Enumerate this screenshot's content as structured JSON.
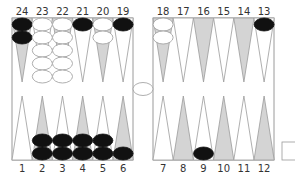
{
  "colors": {
    "board_bg": "#ffffff",
    "border": "#9a9a9a",
    "point_light": "#ffffff",
    "point_dark": "#d4d4d4",
    "checker_black": "#111111",
    "checker_white": "#ffffff",
    "checker_white_stroke": "#9a9a9a"
  },
  "top_points": [
    {
      "label": "24",
      "shade": "dark",
      "checkers": {
        "color": "black",
        "count": 2
      }
    },
    {
      "label": "23",
      "shade": "light",
      "checkers": {
        "color": "white",
        "count": 5
      }
    },
    {
      "label": "22",
      "shade": "dark",
      "checkers": {
        "color": "white",
        "count": 5
      }
    },
    {
      "label": "21",
      "shade": "light",
      "checkers": {
        "color": "black",
        "count": 1
      }
    },
    {
      "label": "20",
      "shade": "dark",
      "checkers": {
        "color": "white",
        "count": 2
      }
    },
    {
      "label": "19",
      "shade": "light",
      "checkers": {
        "color": "black",
        "count": 1
      }
    },
    {
      "label": "18",
      "shade": "dark",
      "checkers": {
        "color": "white",
        "count": 2
      }
    },
    {
      "label": "17",
      "shade": "light",
      "checkers": {
        "color": "none",
        "count": 0
      }
    },
    {
      "label": "16",
      "shade": "dark",
      "checkers": {
        "color": "none",
        "count": 0
      }
    },
    {
      "label": "15",
      "shade": "light",
      "checkers": {
        "color": "none",
        "count": 0
      }
    },
    {
      "label": "14",
      "shade": "dark",
      "checkers": {
        "color": "none",
        "count": 0
      }
    },
    {
      "label": "13",
      "shade": "light",
      "checkers": {
        "color": "black",
        "count": 1
      }
    }
  ],
  "bottom_points": [
    {
      "label": "1",
      "shade": "light",
      "checkers": {
        "color": "none",
        "count": 0
      }
    },
    {
      "label": "2",
      "shade": "dark",
      "checkers": {
        "color": "black",
        "count": 2
      }
    },
    {
      "label": "3",
      "shade": "light",
      "checkers": {
        "color": "black",
        "count": 2
      }
    },
    {
      "label": "4",
      "shade": "dark",
      "checkers": {
        "color": "black",
        "count": 2
      }
    },
    {
      "label": "5",
      "shade": "light",
      "checkers": {
        "color": "black",
        "count": 2
      }
    },
    {
      "label": "6",
      "shade": "dark",
      "checkers": {
        "color": "black",
        "count": 1
      }
    },
    {
      "label": "7",
      "shade": "light",
      "checkers": {
        "color": "none",
        "count": 0
      }
    },
    {
      "label": "8",
      "shade": "dark",
      "checkers": {
        "color": "none",
        "count": 0
      }
    },
    {
      "label": "9",
      "shade": "light",
      "checkers": {
        "color": "black",
        "count": 1
      }
    },
    {
      "label": "10",
      "shade": "dark",
      "checkers": {
        "color": "none",
        "count": 0
      }
    },
    {
      "label": "11",
      "shade": "light",
      "checkers": {
        "color": "none",
        "count": 0
      }
    },
    {
      "label": "12",
      "shade": "dark",
      "checkers": {
        "color": "none",
        "count": 0
      }
    }
  ],
  "bar": {
    "checkers": [],
    "cube": {
      "visible": true,
      "value": ""
    }
  },
  "bear_off_tray": {
    "visible": true
  }
}
